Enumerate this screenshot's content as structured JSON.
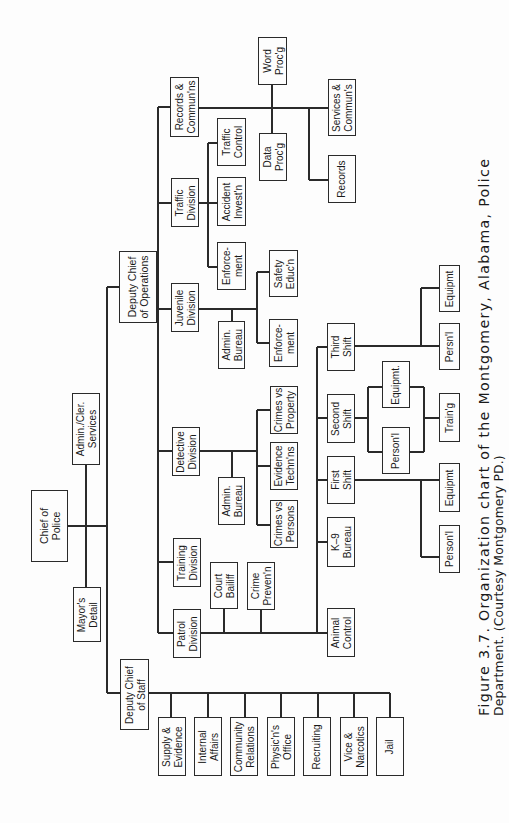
{
  "figure": {
    "caption_line1": "Figure 3.7. Organization chart of the Montgomery, Alabama, Police",
    "caption_line2": "Department. (Courtesy Montgomery PD.)",
    "caption_orientation": "rotated 90° counter-clockwise",
    "line_color": "#2a2a2a",
    "background": "#fdfdfd"
  },
  "org_chart": {
    "root": "Chief of Police",
    "hierarchy": [
      {
        "name": "Chief of Police",
        "children": [
          "Mayor's Detail",
          "Admin./Cler. Services",
          "Deputy Chief of Operations",
          "Deputy Chief of Staff"
        ]
      },
      {
        "name": "Deputy Chief of Operations",
        "children": [
          "Records & Commun'ns",
          "Traffic Division",
          "Juvenile Division",
          "Detective Division",
          "Training Division",
          "Patrol Division"
        ]
      },
      {
        "name": "Records & Commun'ns",
        "children": [
          "Word Proc'g",
          "Data Proc'g",
          "Services & Commun's",
          "Records"
        ]
      },
      {
        "name": "Traffic Division",
        "children": [
          "Traffic Control",
          "Accident Invest'n",
          "Enforcement"
        ]
      },
      {
        "name": "Juvenile Division",
        "children": [
          "Admin. Bureau",
          "Safety Educ'n",
          "Enforcement"
        ]
      },
      {
        "name": "Detective Division",
        "children": [
          "Admin. Bureau",
          "Crimes vs Property",
          "Evidence Techn'ns",
          "Crimes vs Persons"
        ]
      },
      {
        "name": "Patrol Division",
        "children": [
          "Court Bailiff",
          "Crime Preven'n",
          "Animal Control",
          "K-9 Bureau",
          "First Shift",
          "Second Shift",
          "Third Shift"
        ]
      },
      {
        "name": "First Shift",
        "children": [
          "Person'l",
          "Equipmt"
        ]
      },
      {
        "name": "Second Shift",
        "children": [
          "Person'l",
          "Equipmt.",
          "Train'g"
        ]
      },
      {
        "name": "Third Shift",
        "children": [
          "Persn'l",
          "Equipmt"
        ]
      },
      {
        "name": "Deputy Chief of Staff",
        "children": [
          "Supply & Evidence",
          "Internal Affairs",
          "Community Relations",
          "Physic'n's Office",
          "Recruiting",
          "Vice & Narcotics",
          "Jail"
        ]
      }
    ]
  },
  "boxes": [
    {
      "id": "chief-of-police",
      "label": "Chief of\nPolice",
      "x": 31,
      "y": 490,
      "w": 37,
      "h": 72,
      "big": true
    },
    {
      "id": "admin-cler-services",
      "label": "Admin./Cler.\nServices",
      "x": 72,
      "y": 393,
      "w": 28,
      "h": 72
    },
    {
      "id": "mayors-detail",
      "label": "Mayor's\nDetail",
      "x": 73,
      "y": 587,
      "w": 28,
      "h": 55
    },
    {
      "id": "deputy-chief-operations",
      "label": "Deputy Chief\nof Operations",
      "x": 119,
      "y": 251,
      "w": 38,
      "h": 72,
      "big": true
    },
    {
      "id": "deputy-chief-staff",
      "label": "Deputy Chief\nof Staff",
      "x": 120,
      "y": 659,
      "w": 29,
      "h": 71
    },
    {
      "id": "records-communs",
      "label": "Records &\nCommun'ns",
      "x": 170,
      "y": 77,
      "w": 29,
      "h": 60
    },
    {
      "id": "traffic-division",
      "label": "Traffic\nDivision",
      "x": 171,
      "y": 178,
      "w": 28,
      "h": 49
    },
    {
      "id": "juvenile-division",
      "label": "Juvenile\nDivision",
      "x": 171,
      "y": 283,
      "w": 28,
      "h": 49
    },
    {
      "id": "detective-division",
      "label": "Detective\nDivision",
      "x": 172,
      "y": 427,
      "w": 28,
      "h": 49
    },
    {
      "id": "training-division",
      "label": "Training\nDivision",
      "x": 173,
      "y": 538,
      "w": 28,
      "h": 49
    },
    {
      "id": "patrol-division",
      "label": "Patrol\nDivision",
      "x": 173,
      "y": 609,
      "w": 28,
      "h": 49
    },
    {
      "id": "word-procg",
      "label": "Word\nProc'g",
      "x": 258,
      "y": 37,
      "w": 29,
      "h": 48
    },
    {
      "id": "data-procg",
      "label": "Data\nProc'g",
      "x": 259,
      "y": 133,
      "w": 28,
      "h": 48
    },
    {
      "id": "services-communs",
      "label": "Services &\nCommun's",
      "x": 328,
      "y": 79,
      "w": 28,
      "h": 57
    },
    {
      "id": "records",
      "label": "Records",
      "x": 328,
      "y": 155,
      "w": 28,
      "h": 48
    },
    {
      "id": "traffic-control",
      "label": "Traffic\nControl",
      "x": 217,
      "y": 118,
      "w": 29,
      "h": 48
    },
    {
      "id": "accident-investn",
      "label": "Accident\nInvest'n",
      "x": 217,
      "y": 177,
      "w": 29,
      "h": 49
    },
    {
      "id": "traffic-enforcement",
      "label": "Enforce-\nment",
      "x": 217,
      "y": 242,
      "w": 29,
      "h": 48
    },
    {
      "id": "juvenile-admin-bureau",
      "label": "Admin.\nBureau",
      "x": 218,
      "y": 321,
      "w": 27,
      "h": 48
    },
    {
      "id": "safety-education",
      "label": "Safety\nEduc'n",
      "x": 269,
      "y": 250,
      "w": 29,
      "h": 47
    },
    {
      "id": "juvenile-enforcement",
      "label": "Enforce-\nment",
      "x": 269,
      "y": 319,
      "w": 29,
      "h": 48
    },
    {
      "id": "detective-admin-bureau",
      "label": "Admin.\nBureau",
      "x": 218,
      "y": 477,
      "w": 27,
      "h": 48
    },
    {
      "id": "crimes-vs-property",
      "label": "Crimes vs\nProperty",
      "x": 270,
      "y": 386,
      "w": 28,
      "h": 48
    },
    {
      "id": "evidence-technns",
      "label": "Evidence\nTechn'ns",
      "x": 270,
      "y": 442,
      "w": 28,
      "h": 48
    },
    {
      "id": "crimes-vs-persons",
      "label": "Crimes vs\nPersons",
      "x": 270,
      "y": 500,
      "w": 28,
      "h": 48
    },
    {
      "id": "court-bailiff",
      "label": "Court\nBailiff",
      "x": 210,
      "y": 562,
      "w": 28,
      "h": 47
    },
    {
      "id": "crime-prevention",
      "label": "Crime\nPreven'n",
      "x": 247,
      "y": 562,
      "w": 28,
      "h": 48
    },
    {
      "id": "third-shift",
      "label": "Third\nShift",
      "x": 327,
      "y": 323,
      "w": 28,
      "h": 48
    },
    {
      "id": "second-shift",
      "label": "Second\nShift",
      "x": 327,
      "y": 394,
      "w": 28,
      "h": 49
    },
    {
      "id": "first-shift",
      "label": "First\nShift",
      "x": 327,
      "y": 456,
      "w": 28,
      "h": 48
    },
    {
      "id": "k9-bureau",
      "label": "K–9\nBureau",
      "x": 327,
      "y": 517,
      "w": 28,
      "h": 50
    },
    {
      "id": "animal-control",
      "label": "Animal\nControl",
      "x": 327,
      "y": 608,
      "w": 28,
      "h": 49
    },
    {
      "id": "third-shift-equipment",
      "label": "Equipmt",
      "x": 439,
      "y": 265,
      "w": 21,
      "h": 47
    },
    {
      "id": "third-shift-personnel",
      "label": "Persn'l",
      "x": 439,
      "y": 323,
      "w": 21,
      "h": 47
    },
    {
      "id": "second-shift-equipment",
      "label": "Equipmt.",
      "x": 382,
      "y": 361,
      "w": 28,
      "h": 47
    },
    {
      "id": "second-shift-personnel",
      "label": "Person'l",
      "x": 382,
      "y": 427,
      "w": 28,
      "h": 47
    },
    {
      "id": "second-shift-training",
      "label": "Train'g",
      "x": 439,
      "y": 393,
      "w": 21,
      "h": 49
    },
    {
      "id": "first-shift-equipment",
      "label": "Equipmt",
      "x": 439,
      "y": 463,
      "w": 21,
      "h": 49
    },
    {
      "id": "first-shift-personnel",
      "label": "Person'l",
      "x": 439,
      "y": 525,
      "w": 21,
      "h": 48
    },
    {
      "id": "supply-evidence",
      "label": "Supply &\nEvidence",
      "x": 158,
      "y": 717,
      "w": 28,
      "h": 59
    },
    {
      "id": "internal-affairs",
      "label": "Internal\nAffairs",
      "x": 194,
      "y": 717,
      "w": 28,
      "h": 59
    },
    {
      "id": "community-relations",
      "label": "Community\nRelations",
      "x": 230,
      "y": 717,
      "w": 28,
      "h": 59
    },
    {
      "id": "physicians-office",
      "label": "Physic'n's\nOffice",
      "x": 267,
      "y": 717,
      "w": 28,
      "h": 59
    },
    {
      "id": "recruiting",
      "label": "Recruiting",
      "x": 303,
      "y": 717,
      "w": 28,
      "h": 59
    },
    {
      "id": "vice-narcotics",
      "label": "Vice &\nNarcotics",
      "x": 340,
      "y": 717,
      "w": 28,
      "h": 59
    },
    {
      "id": "jail",
      "label": "Jail",
      "x": 376,
      "y": 717,
      "w": 28,
      "h": 59
    }
  ],
  "lines": [
    {
      "x1": 68,
      "y1": 526,
      "x2": 107,
      "y2": 526
    },
    {
      "x1": 86,
      "y1": 465,
      "x2": 86,
      "y2": 587
    },
    {
      "x1": 107,
      "y1": 287,
      "x2": 107,
      "y2": 693
    },
    {
      "x1": 107,
      "y1": 287,
      "x2": 119,
      "y2": 287
    },
    {
      "x1": 107,
      "y1": 693,
      "x2": 120,
      "y2": 693
    },
    {
      "x1": 157,
      "y1": 287,
      "x2": 158,
      "y2": 287
    },
    {
      "x1": 158,
      "y1": 107,
      "x2": 158,
      "y2": 633
    },
    {
      "x1": 158,
      "y1": 107,
      "x2": 170,
      "y2": 107
    },
    {
      "x1": 158,
      "y1": 203,
      "x2": 171,
      "y2": 203
    },
    {
      "x1": 158,
      "y1": 309,
      "x2": 171,
      "y2": 309
    },
    {
      "x1": 158,
      "y1": 451,
      "x2": 172,
      "y2": 451
    },
    {
      "x1": 158,
      "y1": 562,
      "x2": 173,
      "y2": 562
    },
    {
      "x1": 158,
      "y1": 633,
      "x2": 173,
      "y2": 633
    },
    {
      "x1": 199,
      "y1": 108,
      "x2": 328,
      "y2": 108
    },
    {
      "x1": 272,
      "y1": 85,
      "x2": 272,
      "y2": 133
    },
    {
      "x1": 309,
      "y1": 108,
      "x2": 309,
      "y2": 180
    },
    {
      "x1": 309,
      "y1": 180,
      "x2": 328,
      "y2": 180
    },
    {
      "x1": 199,
      "y1": 203,
      "x2": 208,
      "y2": 203
    },
    {
      "x1": 208,
      "y1": 143,
      "x2": 208,
      "y2": 267
    },
    {
      "x1": 208,
      "y1": 143,
      "x2": 217,
      "y2": 143
    },
    {
      "x1": 208,
      "y1": 203,
      "x2": 217,
      "y2": 203
    },
    {
      "x1": 208,
      "y1": 267,
      "x2": 217,
      "y2": 267
    },
    {
      "x1": 199,
      "y1": 309,
      "x2": 257,
      "y2": 309
    },
    {
      "x1": 232,
      "y1": 309,
      "x2": 232,
      "y2": 321
    },
    {
      "x1": 257,
      "y1": 272,
      "x2": 257,
      "y2": 343
    },
    {
      "x1": 257,
      "y1": 272,
      "x2": 269,
      "y2": 272
    },
    {
      "x1": 257,
      "y1": 343,
      "x2": 269,
      "y2": 343
    },
    {
      "x1": 200,
      "y1": 451,
      "x2": 257,
      "y2": 451
    },
    {
      "x1": 232,
      "y1": 451,
      "x2": 232,
      "y2": 477
    },
    {
      "x1": 257,
      "y1": 410,
      "x2": 257,
      "y2": 525
    },
    {
      "x1": 257,
      "y1": 410,
      "x2": 270,
      "y2": 410
    },
    {
      "x1": 257,
      "y1": 466,
      "x2": 270,
      "y2": 466
    },
    {
      "x1": 257,
      "y1": 525,
      "x2": 270,
      "y2": 525
    },
    {
      "x1": 201,
      "y1": 633,
      "x2": 317,
      "y2": 633
    },
    {
      "x1": 224,
      "y1": 609,
      "x2": 224,
      "y2": 633
    },
    {
      "x1": 261,
      "y1": 610,
      "x2": 261,
      "y2": 633
    },
    {
      "x1": 317,
      "y1": 347,
      "x2": 317,
      "y2": 633
    },
    {
      "x1": 317,
      "y1": 347,
      "x2": 327,
      "y2": 347
    },
    {
      "x1": 317,
      "y1": 418,
      "x2": 327,
      "y2": 418
    },
    {
      "x1": 317,
      "y1": 480,
      "x2": 327,
      "y2": 480
    },
    {
      "x1": 317,
      "y1": 542,
      "x2": 327,
      "y2": 542
    },
    {
      "x1": 317,
      "y1": 633,
      "x2": 327,
      "y2": 633
    },
    {
      "x1": 355,
      "y1": 346,
      "x2": 439,
      "y2": 346
    },
    {
      "x1": 421,
      "y1": 288,
      "x2": 421,
      "y2": 346
    },
    {
      "x1": 421,
      "y1": 288,
      "x2": 439,
      "y2": 288
    },
    {
      "x1": 355,
      "y1": 418,
      "x2": 368,
      "y2": 418
    },
    {
      "x1": 368,
      "y1": 387,
      "x2": 368,
      "y2": 452
    },
    {
      "x1": 368,
      "y1": 387,
      "x2": 382,
      "y2": 387
    },
    {
      "x1": 368,
      "y1": 452,
      "x2": 382,
      "y2": 452
    },
    {
      "x1": 410,
      "y1": 387,
      "x2": 424,
      "y2": 387
    },
    {
      "x1": 410,
      "y1": 452,
      "x2": 424,
      "y2": 452
    },
    {
      "x1": 424,
      "y1": 387,
      "x2": 424,
      "y2": 452
    },
    {
      "x1": 424,
      "y1": 418,
      "x2": 439,
      "y2": 418
    },
    {
      "x1": 355,
      "y1": 480,
      "x2": 439,
      "y2": 480
    },
    {
      "x1": 421,
      "y1": 480,
      "x2": 421,
      "y2": 557
    },
    {
      "x1": 421,
      "y1": 557,
      "x2": 439,
      "y2": 557
    },
    {
      "x1": 149,
      "y1": 693,
      "x2": 390,
      "y2": 693
    },
    {
      "x1": 171,
      "y1": 693,
      "x2": 171,
      "y2": 717
    },
    {
      "x1": 208,
      "y1": 693,
      "x2": 208,
      "y2": 717
    },
    {
      "x1": 245,
      "y1": 693,
      "x2": 245,
      "y2": 717
    },
    {
      "x1": 281,
      "y1": 693,
      "x2": 281,
      "y2": 717
    },
    {
      "x1": 318,
      "y1": 693,
      "x2": 318,
      "y2": 717
    },
    {
      "x1": 354,
      "y1": 693,
      "x2": 354,
      "y2": 717
    },
    {
      "x1": 390,
      "y1": 693,
      "x2": 390,
      "y2": 717
    }
  ],
  "caption_layout": {
    "line1_x": 476,
    "line1_y": 716,
    "line2_x": 492,
    "line2_y": 716
  }
}
